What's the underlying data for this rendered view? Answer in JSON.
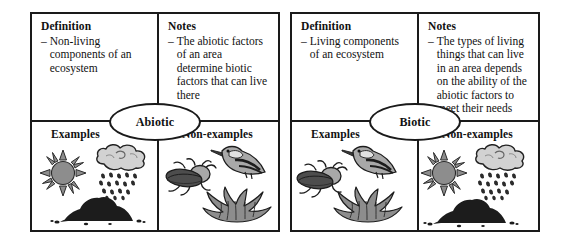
{
  "document": {
    "type": "frayer-model-concept-map-pair",
    "background_color": "#ffffff",
    "border_color": "#1a1a1a"
  },
  "maps": [
    {
      "concept_label": "Abiotic",
      "quadrants": {
        "definition": {
          "title": "Definition",
          "bullet_marker": "–",
          "text": "Non-living components of an ecosystem"
        },
        "notes": {
          "title": "Notes",
          "bullet_marker": "–",
          "text": "The abiotic factors of an area determine biotic factors that can live there"
        },
        "examples": {
          "title": "Examples",
          "icons": [
            "sun-icon",
            "rain-cloud-icon",
            "soil-pile-icon"
          ]
        },
        "non_examples": {
          "title": "Non-examples",
          "icons": [
            "beetle-icon",
            "bird-icon",
            "grass-clump-icon"
          ]
        }
      }
    },
    {
      "concept_label": "Biotic",
      "quadrants": {
        "definition": {
          "title": "Definition",
          "bullet_marker": "–",
          "text": "Living components of an ecosystem"
        },
        "notes": {
          "title": "Notes",
          "bullet_marker": "–",
          "text": "The types of living things that can live in an area depends on the ability of the abiotic factors to meet their needs"
        },
        "examples": {
          "title": "Examples",
          "icons": [
            "beetle-icon",
            "bird-icon",
            "grass-clump-icon"
          ]
        },
        "non_examples": {
          "title": "Non-examples",
          "icons": [
            "sun-icon",
            "rain-cloud-icon",
            "soil-pile-icon"
          ]
        }
      }
    }
  ],
  "palette": {
    "ink": "#1a1a1a",
    "mid_gray": "#8d8d8d",
    "light_gray": "#c9c9c9",
    "dark_gray": "#4d4d4d",
    "near_black": "#1c1c1c"
  }
}
